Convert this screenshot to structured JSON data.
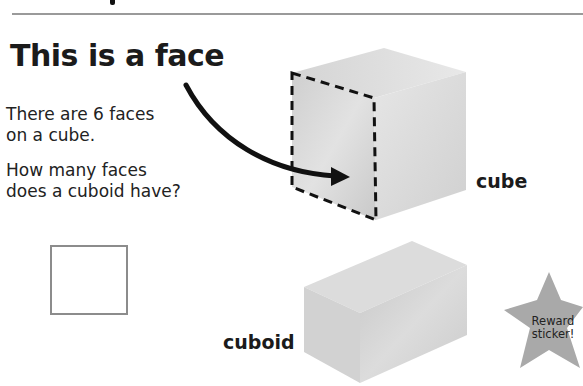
{
  "heading": "This is a face",
  "text": {
    "statement_line1": "There are 6 faces",
    "statement_line2": "on a cube.",
    "question_line1": "How many faces",
    "question_line2": "does a cuboid have?"
  },
  "answer_box": {
    "value": ""
  },
  "labels": {
    "cube": "cube",
    "cuboid": "cuboid"
  },
  "sticker": {
    "line1": "Reward",
    "line2": "sticker!"
  },
  "colors": {
    "shape_fill": "#d8d8d8",
    "star_fill": "#a9a9a9",
    "text": "#1b1b1b"
  }
}
